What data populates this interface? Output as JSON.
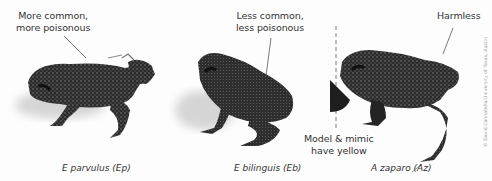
{
  "figure": {
    "frogs": [
      {
        "id": "ep",
        "annotation_lines": [
          "More common,",
          "more poisonous"
        ],
        "caption": "E parvulus (Ep)"
      },
      {
        "id": "eb",
        "annotation_lines": [
          "Less common,",
          "less poisonous"
        ],
        "caption": "E bilinguis (Eb)"
      },
      {
        "id": "az",
        "annotation_lines": [
          "Harmless"
        ],
        "caption": "A zaparo (Az)"
      }
    ],
    "divider_note_lines": [
      "Model & mimic",
      "have yellow"
    ],
    "credit": "© David Cannatella/University of Texas, Austin",
    "colors": {
      "background": "#fdfdfd",
      "frog_body": "#2b2b2b",
      "frog_speckle": "#8c8c8c",
      "shadow": "#d9d9d9",
      "text": "#333333",
      "divider": "#9a9a9a"
    }
  }
}
